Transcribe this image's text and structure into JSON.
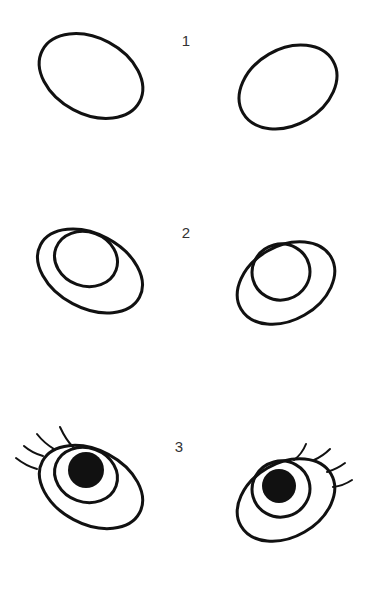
{
  "steps": [
    {
      "label": "1",
      "description": "Draw two tilted ovals"
    },
    {
      "label": "2",
      "description": "Add an inner circle for the iris"
    },
    {
      "label": "3",
      "description": "Add pupils and eyelashes"
    }
  ],
  "colors": {
    "background": "#ffffff",
    "ink": "#111111",
    "label": "#333333"
  }
}
